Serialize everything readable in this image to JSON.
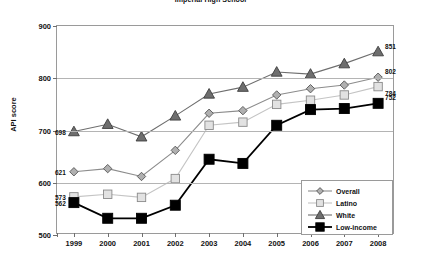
{
  "chart_data": {
    "type": "line",
    "title": "Imperial High School",
    "xlabel": "",
    "ylabel": "API score",
    "categories": [
      "1999",
      "2000",
      "2001",
      "2002",
      "2003",
      "2004",
      "2005",
      "2006",
      "2007",
      "2008"
    ],
    "ylim": [
      500,
      900
    ],
    "yticks": [
      500,
      600,
      700,
      800,
      900
    ],
    "grid": true,
    "legend_position": "bottom-right",
    "series": [
      {
        "name": "Overall",
        "marker": "diamond",
        "color": "#8c8c8c",
        "values": [
          621,
          627,
          612,
          662,
          733,
          738,
          768,
          780,
          787,
          802
        ],
        "start_label": "621",
        "end_label": "802"
      },
      {
        "name": "Latino",
        "marker": "square-open",
        "color": "#c4c4c4",
        "values": [
          573,
          578,
          572,
          608,
          710,
          716,
          750,
          758,
          768,
          784
        ],
        "start_label": "573",
        "end_label": "784"
      },
      {
        "name": "White",
        "marker": "triangle",
        "color": "#6e6e6e",
        "values": [
          698,
          712,
          688,
          728,
          770,
          783,
          812,
          808,
          828,
          851
        ],
        "start_label": "698",
        "end_label": "851"
      },
      {
        "name": "Low-income",
        "marker": "square-filled",
        "color": "#000000",
        "values": [
          562,
          532,
          532,
          557,
          645,
          637,
          710,
          740,
          742,
          752
        ],
        "start_label": "562",
        "end_label": "752"
      }
    ]
  }
}
